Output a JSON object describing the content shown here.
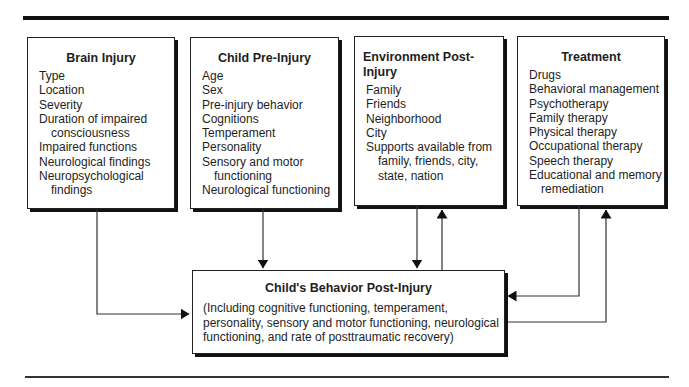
{
  "diagram": {
    "boxes": [
      {
        "title": "Brain Injury",
        "items": [
          "Type",
          "Location",
          "Severity",
          "Duration of impaired consciousness",
          "Impaired functions",
          "Neurological findings",
          "Neuropsychological findings"
        ]
      },
      {
        "title": "Child Pre-Injury",
        "items": [
          "Age",
          "Sex",
          "Pre-injury behavior",
          "Cognitions",
          "Temperament",
          "Personality",
          "Sensory and motor functioning",
          "Neurological functioning"
        ]
      },
      {
        "title": "Environment Post-Injury",
        "items": [
          "Family",
          "Friends",
          "Neighborhood",
          "City",
          "Supports available from family, friends, city, state, nation"
        ]
      },
      {
        "title": "Treatment",
        "items": [
          "Drugs",
          "Behavioral management",
          "Psychotherapy",
          "Family therapy",
          "Physical therapy",
          "Occupational therapy",
          "Speech therapy",
          "Educational and memory remediation"
        ]
      }
    ],
    "outcome": {
      "title": "Child's Behavior Post-Injury",
      "body": "(Including cognitive functioning, temperament, personality, sensory and motor functioning, neurological functioning, and rate of posttraumatic recovery)"
    },
    "connections": [
      {
        "from": "Brain Injury",
        "to": "Child's Behavior Post-Injury",
        "direction": "one-way"
      },
      {
        "from": "Child Pre-Injury",
        "to": "Child's Behavior Post-Injury",
        "direction": "one-way"
      },
      {
        "from": "Environment Post-Injury",
        "to": "Child's Behavior Post-Injury",
        "direction": "two-way"
      },
      {
        "from": "Treatment",
        "to": "Child's Behavior Post-Injury",
        "direction": "two-way"
      }
    ]
  }
}
